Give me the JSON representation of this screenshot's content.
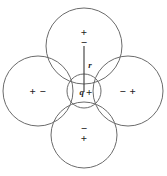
{
  "figure": {
    "width": 167,
    "height": 176,
    "background_color": "#ffffff",
    "stroke_color": "#6b6b6b",
    "text_color": "#1c1c1c"
  },
  "center": {
    "charge_symbol": "q",
    "charge_sign": "+",
    "cx": 84,
    "cy": 91,
    "r": 17
  },
  "radius": {
    "label": "r",
    "label_x": 90,
    "label_y": 65,
    "x1": 84,
    "y1": 46,
    "x2": 84,
    "y2": 92
  },
  "dipoles": [
    {
      "position": "top",
      "cx": 84,
      "cy": 46,
      "r": 38,
      "layout": "vertical",
      "near_sign": "+",
      "far_sign": "−",
      "signs": [
        "+",
        "−"
      ],
      "label_x": 84,
      "label_y": 37
    },
    {
      "position": "left",
      "cx": 38,
      "cy": 91,
      "r": 35,
      "layout": "horizontal",
      "near_sign": "+",
      "far_sign": "−",
      "signs": [
        "+",
        "−"
      ],
      "text": "+ −",
      "label_x": 38,
      "label_y": 91
    },
    {
      "position": "right",
      "cx": 128,
      "cy": 91,
      "r": 35,
      "layout": "horizontal",
      "near_sign": "−",
      "far_sign": "+",
      "signs": [
        "−",
        "+"
      ],
      "text": "− +",
      "label_x": 128,
      "label_y": 91
    },
    {
      "position": "bottom",
      "cx": 84,
      "cy": 135,
      "r": 33,
      "layout": "vertical",
      "near_sign": "−",
      "far_sign": "+",
      "signs": [
        "−",
        "+"
      ],
      "label_x": 84,
      "label_y": 133
    }
  ]
}
